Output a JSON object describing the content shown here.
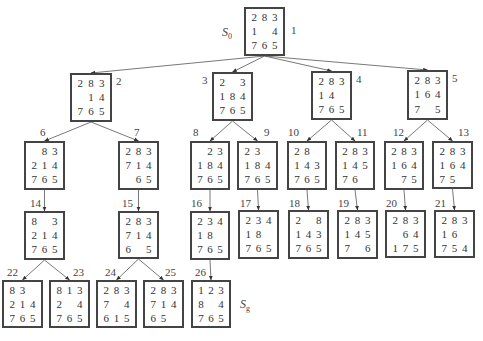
{
  "diagram": {
    "type": "search-tree",
    "start_label": "S",
    "start_sub": "0",
    "goal_label": "S",
    "goal_sub": "g"
  },
  "nodes": [
    {
      "id": 1,
      "label": "1",
      "x": 244,
      "y": 7,
      "w": 41,
      "h": 49,
      "lx": 291,
      "ly": 25,
      "cells": [
        "2",
        "8",
        "3",
        "1",
        "",
        "4",
        "7",
        "6",
        "5"
      ]
    },
    {
      "id": 2,
      "label": "2",
      "x": 70,
      "y": 73,
      "w": 42,
      "h": 49,
      "lx": 116,
      "ly": 76,
      "cells": [
        "2",
        "8",
        "3",
        "",
        "1",
        "4",
        "7",
        "6",
        "5"
      ]
    },
    {
      "id": 3,
      "label": "3",
      "x": 212,
      "y": 72,
      "w": 41,
      "h": 49,
      "lx": 202,
      "ly": 75,
      "cells": [
        "2",
        "",
        "3",
        "1",
        "8",
        "4",
        "7",
        "6",
        "5"
      ]
    },
    {
      "id": 4,
      "label": "4",
      "x": 311,
      "y": 71,
      "w": 41,
      "h": 49,
      "lx": 356,
      "ly": 74,
      "cells": [
        "2",
        "8",
        "3",
        "1",
        "4",
        "",
        "7",
        "6",
        "5"
      ]
    },
    {
      "id": 5,
      "label": "5",
      "x": 407,
      "y": 70,
      "w": 41,
      "h": 50,
      "lx": 452,
      "ly": 73,
      "cells": [
        "2",
        "8",
        "3",
        "1",
        "6",
        "4",
        "7",
        "",
        "5"
      ]
    },
    {
      "id": 6,
      "label": "6",
      "x": 24,
      "y": 141,
      "w": 41,
      "h": 49,
      "lx": 40,
      "ly": 127,
      "cells": [
        "",
        "8",
        "3",
        "2",
        "1",
        "4",
        "7",
        "6",
        "5"
      ]
    },
    {
      "id": 7,
      "label": "7",
      "x": 118,
      "y": 141,
      "w": 41,
      "h": 49,
      "lx": 134,
      "ly": 127,
      "cells": [
        "2",
        "8",
        "3",
        "7",
        "1",
        "4",
        "",
        "6",
        "5"
      ]
    },
    {
      "id": 8,
      "label": "8",
      "x": 190,
      "y": 141,
      "w": 40,
      "h": 49,
      "lx": 193,
      "ly": 127,
      "cells": [
        "",
        "2",
        "3",
        "1",
        "8",
        "4",
        "7",
        "6",
        "5"
      ]
    },
    {
      "id": 9,
      "label": "9",
      "x": 237,
      "y": 141,
      "w": 41,
      "h": 49,
      "lx": 264,
      "ly": 127,
      "cells": [
        "2",
        "3",
        "",
        "1",
        "8",
        "4",
        "7",
        "6",
        "5"
      ]
    },
    {
      "id": 10,
      "label": "10",
      "x": 287,
      "y": 141,
      "w": 40,
      "h": 49,
      "lx": 288,
      "ly": 127,
      "cells": [
        "2",
        "8",
        "",
        "1",
        "4",
        "3",
        "7",
        "6",
        "5"
      ]
    },
    {
      "id": 11,
      "label": "11",
      "x": 335,
      "y": 141,
      "w": 40,
      "h": 49,
      "lx": 357,
      "ly": 127,
      "cells": [
        "2",
        "8",
        "3",
        "1",
        "4",
        "5",
        "7",
        "6",
        ""
      ]
    },
    {
      "id": 12,
      "label": "12",
      "x": 384,
      "y": 141,
      "w": 40,
      "h": 49,
      "lx": 393,
      "ly": 127,
      "cells": [
        "2",
        "8",
        "3",
        "1",
        "6",
        "4",
        "",
        "7",
        "5"
      ]
    },
    {
      "id": 13,
      "label": "13",
      "x": 432,
      "y": 141,
      "w": 41,
      "h": 48,
      "lx": 458,
      "ly": 127,
      "cells": [
        "2",
        "8",
        "3",
        "1",
        "6",
        "4",
        "7",
        "5",
        ""
      ]
    },
    {
      "id": 14,
      "label": "14",
      "x": 24,
      "y": 211,
      "w": 41,
      "h": 49,
      "lx": 30,
      "ly": 198,
      "cells": [
        "8",
        "",
        "3",
        "2",
        "1",
        "4",
        "7",
        "6",
        "5"
      ]
    },
    {
      "id": 15,
      "label": "15",
      "x": 118,
      "y": 211,
      "w": 41,
      "h": 48,
      "lx": 122,
      "ly": 198,
      "cells": [
        "2",
        "8",
        "3",
        "7",
        "1",
        "4",
        "6",
        "",
        "5"
      ]
    },
    {
      "id": 16,
      "label": "16",
      "x": 190,
      "y": 211,
      "w": 40,
      "h": 49,
      "lx": 191,
      "ly": 198,
      "cells": [
        "2",
        "3",
        "4",
        "1",
        "8",
        "",
        "7",
        "6",
        "5"
      ]
    },
    {
      "id": 17,
      "label": "17",
      "x": 238,
      "y": 210,
      "w": 41,
      "h": 49,
      "lx": 240,
      "ly": 198,
      "cells": [
        "2",
        "3",
        "4",
        "1",
        "8",
        "",
        "7",
        "6",
        "5"
      ]
    },
    {
      "id": 18,
      "label": "18",
      "x": 288,
      "y": 210,
      "w": 41,
      "h": 49,
      "lx": 289,
      "ly": 198,
      "cells": [
        "2",
        "",
        "8",
        "1",
        "4",
        "3",
        "7",
        "6",
        "5"
      ]
    },
    {
      "id": 19,
      "label": "19",
      "x": 337,
      "y": 210,
      "w": 41,
      "h": 49,
      "lx": 338,
      "ly": 198,
      "cells": [
        "2",
        "8",
        "3",
        "1",
        "4",
        "5",
        "7",
        "",
        "6"
      ]
    },
    {
      "id": 20,
      "label": "20",
      "x": 385,
      "y": 210,
      "w": 41,
      "h": 48,
      "lx": 386,
      "ly": 198,
      "cells": [
        "2",
        "8",
        "3",
        "",
        "6",
        "4",
        "1",
        "7",
        "5"
      ]
    },
    {
      "id": 21,
      "label": "21",
      "x": 434,
      "y": 210,
      "w": 41,
      "h": 48,
      "lx": 435,
      "ly": 198,
      "cells": [
        "2",
        "8",
        "3",
        "1",
        "6",
        "",
        "7",
        "5",
        "4"
      ]
    },
    {
      "id": 22,
      "label": "22",
      "x": 2,
      "y": 280,
      "w": 41,
      "h": 48,
      "lx": 7,
      "ly": 267,
      "cells": [
        "8",
        "3",
        "",
        "2",
        "1",
        "4",
        "7",
        "6",
        "5"
      ]
    },
    {
      "id": 23,
      "label": "23",
      "x": 49,
      "y": 280,
      "w": 41,
      "h": 48,
      "lx": 73,
      "ly": 267,
      "cells": [
        "8",
        "1",
        "3",
        "2",
        "",
        "4",
        "7",
        "6",
        "5"
      ]
    },
    {
      "id": 24,
      "label": "24",
      "x": 96,
      "y": 280,
      "w": 41,
      "h": 48,
      "lx": 105,
      "ly": 267,
      "cells": [
        "2",
        "8",
        "3",
        "7",
        "",
        "4",
        "6",
        "1",
        "5"
      ]
    },
    {
      "id": 25,
      "label": "25",
      "x": 143,
      "y": 280,
      "w": 41,
      "h": 48,
      "lx": 165,
      "ly": 267,
      "cells": [
        "2",
        "8",
        "3",
        "7",
        "1",
        "4",
        "6",
        "5",
        ""
      ]
    },
    {
      "id": 26,
      "label": "26",
      "x": 191,
      "y": 280,
      "w": 40,
      "h": 48,
      "lx": 195,
      "ly": 267,
      "cells": [
        "1",
        "2",
        "3",
        "8",
        "",
        "4",
        "7",
        "6",
        "5"
      ]
    }
  ],
  "edges": [
    [
      1,
      2
    ],
    [
      1,
      3
    ],
    [
      1,
      4
    ],
    [
      1,
      5
    ],
    [
      2,
      6
    ],
    [
      2,
      7
    ],
    [
      3,
      8
    ],
    [
      3,
      9
    ],
    [
      4,
      10
    ],
    [
      4,
      11
    ],
    [
      5,
      12
    ],
    [
      5,
      13
    ],
    [
      6,
      14
    ],
    [
      7,
      15
    ],
    [
      8,
      16
    ],
    [
      9,
      17
    ],
    [
      10,
      18
    ],
    [
      11,
      19
    ],
    [
      12,
      20
    ],
    [
      13,
      21
    ],
    [
      14,
      22
    ],
    [
      14,
      23
    ],
    [
      15,
      24
    ],
    [
      15,
      25
    ],
    [
      16,
      26
    ]
  ],
  "start_pos": {
    "x": 222,
    "y": 25
  },
  "goal_pos": {
    "x": 240,
    "y": 297
  }
}
